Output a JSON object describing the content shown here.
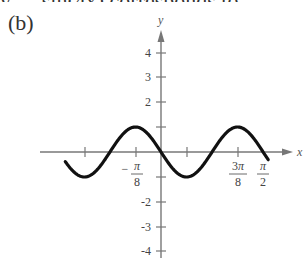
{
  "header": {
    "cut_text": "y = -sin(4x) corresponds to",
    "part_label": "(b)"
  },
  "chart_data": {
    "type": "line",
    "title": "",
    "xlabel": "x",
    "ylabel": "y",
    "function": "y = -sin(4x)",
    "xlim": [
      -1.28,
      0.97
    ],
    "ylim": [
      -4.3,
      4.6
    ],
    "grid": false,
    "legend": null,
    "x_ticks": [
      {
        "value": -1.1781,
        "label": ""
      },
      {
        "value": -0.3927,
        "label": "-π/8"
      },
      {
        "value": 0.3927,
        "label": ""
      },
      {
        "value": 1.1781,
        "label": "3π/8"
      },
      {
        "value": 1.5708,
        "label": "π/2"
      }
    ],
    "y_ticks": [
      {
        "value": 4,
        "label": "4"
      },
      {
        "value": 3,
        "label": "3"
      },
      {
        "value": 2,
        "label": "2"
      },
      {
        "value": 1,
        "label": ""
      },
      {
        "value": -1,
        "label": ""
      },
      {
        "value": -2,
        "label": "-2"
      },
      {
        "value": -3,
        "label": "-3"
      },
      {
        "value": -4,
        "label": "-4"
      }
    ],
    "series": [
      {
        "name": "y = -sin(4x)",
        "x": [
          -1.4726,
          -1.1781,
          -0.7854,
          -0.3927,
          0,
          0.3927,
          0.7854,
          1.1781,
          1.5708,
          1.6493
        ],
        "y": [
          0.71,
          -1,
          0,
          1,
          0,
          -1,
          0,
          1,
          0,
          -0.31
        ]
      }
    ],
    "annotations": [
      {
        "text": "-π/8",
        "x": -0.3927
      },
      {
        "text": "3π/8",
        "x": 1.1781
      },
      {
        "text": "π/2",
        "x": 1.5708
      }
    ]
  }
}
